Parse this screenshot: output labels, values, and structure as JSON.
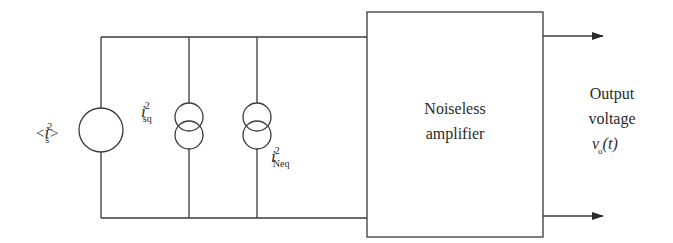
{
  "diagram": {
    "type": "circuit-noise-model",
    "source": {
      "label_prefix": "<",
      "symbol": "i",
      "superscript": "2",
      "subscript": "s",
      "label_suffix": ">"
    },
    "shot_noise_source": {
      "symbol": "i",
      "superscript": "2",
      "subscript": "sq"
    },
    "equivalent_noise_source": {
      "symbol": "i",
      "superscript": "2",
      "subscript": "Neq"
    },
    "amplifier": {
      "line1": "Noiseless",
      "line2": "amplifier"
    },
    "output": {
      "line1": "Output",
      "line2": "voltage",
      "symbol": "ν",
      "subscript": "o",
      "arg": "(t)"
    },
    "colors": {
      "stroke": "#3a3a3a",
      "text": "#2a2a2a",
      "background": "#ffffff"
    }
  }
}
